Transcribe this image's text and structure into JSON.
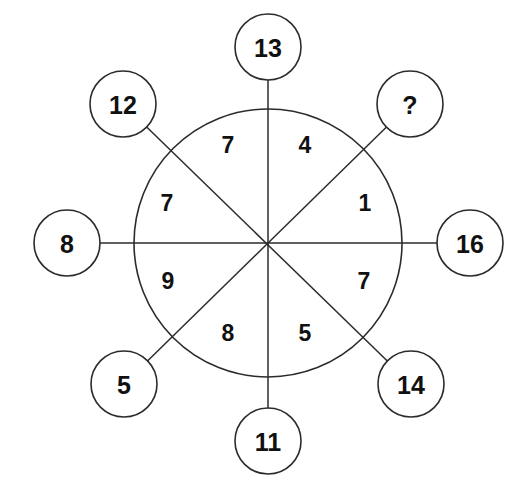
{
  "diagram": {
    "kind": "wheel-puzzle",
    "background_color": "#ffffff",
    "stroke_color": "#2b2b2b",
    "text_color": "#111111",
    "center": {
      "x": 268,
      "y": 243
    },
    "wheel_radius": 134,
    "node_radius": 33,
    "node_distance": 224,
    "outer_nodes": [
      {
        "id": "node-top",
        "label": "13",
        "angle_deg": 270,
        "cx": 268,
        "cy": 47,
        "unknown": false
      },
      {
        "id": "node-top-right",
        "label": "?",
        "angle_deg": 315,
        "cx": 410,
        "cy": 104,
        "unknown": true
      },
      {
        "id": "node-right",
        "label": "16",
        "angle_deg": 0,
        "cx": 470,
        "cy": 243,
        "unknown": false
      },
      {
        "id": "node-bottom-right",
        "label": "14",
        "angle_deg": 45,
        "cx": 411,
        "cy": 384,
        "unknown": false
      },
      {
        "id": "node-bottom",
        "label": "11",
        "angle_deg": 90,
        "cx": 268,
        "cy": 441,
        "unknown": false
      },
      {
        "id": "node-bottom-left",
        "label": "5",
        "angle_deg": 135,
        "cx": 124,
        "cy": 384,
        "unknown": false
      },
      {
        "id": "node-left",
        "label": "8",
        "angle_deg": 180,
        "cx": 67,
        "cy": 243,
        "unknown": false
      },
      {
        "id": "node-top-left",
        "label": "12",
        "angle_deg": 225,
        "cx": 123,
        "cy": 104,
        "unknown": false
      }
    ],
    "inner_sectors": [
      {
        "id": "sector-top-right",
        "label": "4",
        "tx": 305,
        "ty": 145
      },
      {
        "id": "sector-right-upper",
        "label": "1",
        "tx": 365,
        "ty": 203
      },
      {
        "id": "sector-right-lower",
        "label": "7",
        "tx": 364,
        "ty": 281
      },
      {
        "id": "sector-bottom-right",
        "label": "5",
        "tx": 305,
        "ty": 333
      },
      {
        "id": "sector-bottom-left",
        "label": "8",
        "tx": 228,
        "ty": 333
      },
      {
        "id": "sector-left-lower",
        "label": "9",
        "tx": 168,
        "ty": 281
      },
      {
        "id": "sector-left-upper",
        "label": "7",
        "tx": 167,
        "ty": 203
      },
      {
        "id": "sector-top-left",
        "label": "7",
        "tx": 228,
        "ty": 145
      }
    ],
    "spokes": [
      {
        "id": "spoke-vertical",
        "x1": 268,
        "y1": 47,
        "x2": 268,
        "y2": 441
      },
      {
        "id": "spoke-horizontal",
        "x1": 67,
        "y1": 243,
        "x2": 470,
        "y2": 243
      },
      {
        "id": "spoke-diag-nw-se",
        "x1": 123,
        "y1": 104,
        "x2": 411,
        "y2": 384
      },
      {
        "id": "spoke-diag-ne-sw",
        "x1": 410,
        "y1": 104,
        "x2": 124,
        "y2": 384
      }
    ]
  }
}
